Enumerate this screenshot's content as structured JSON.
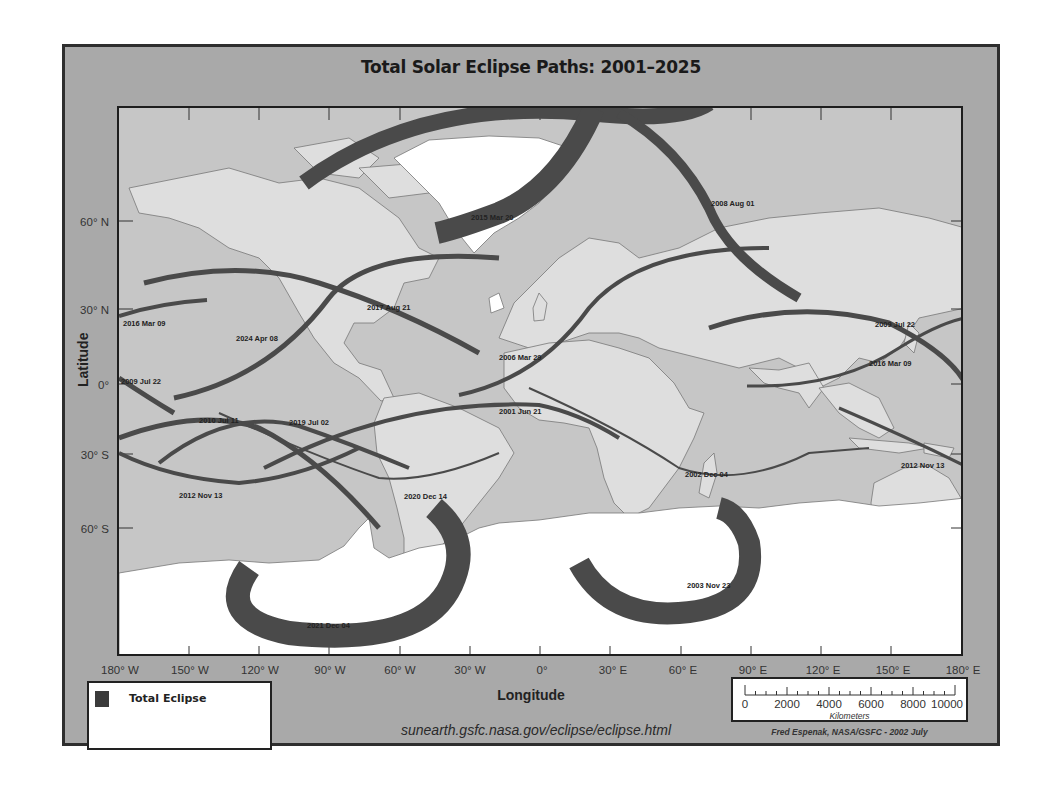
{
  "title": "Total Solar Eclipse Paths: 2001–2025",
  "axes": {
    "x_title": "Longitude",
    "y_title": "Latitude",
    "x_ticks": [
      "180° W",
      "150° W",
      "120° W",
      "90° W",
      "60° W",
      "30° W",
      "0°",
      "30° E",
      "60° E",
      "90° E",
      "120° E",
      "150° E",
      "180° E"
    ],
    "y_ticks": [
      "60° N",
      "30° N",
      "0°",
      "30° S",
      "60° S"
    ]
  },
  "legend": {
    "items": [
      {
        "label": "Total Eclipse",
        "color": "#3b3b3b"
      }
    ]
  },
  "scale_bar": {
    "values": [
      "0",
      "2000",
      "4000",
      "6000",
      "8000",
      "10000"
    ],
    "unit": "Kilometers"
  },
  "url": "sunearth.gsfc.nasa.gov/eclipse/eclipse.html",
  "credit": "Fred Espenak, NASA/GSFC - 2002 July",
  "eclipse_paths": [
    {
      "date": "2001 Jun 21"
    },
    {
      "date": "2002 Dec 04"
    },
    {
      "date": "2003 Nov 23"
    },
    {
      "date": "2006 Mar 29"
    },
    {
      "date": "2008 Aug 01"
    },
    {
      "date": "2009 Jul 22"
    },
    {
      "date": "2010 Jul 11"
    },
    {
      "date": "2012 Nov 13"
    },
    {
      "date": "2015 Mar 20"
    },
    {
      "date": "2016 Mar 09"
    },
    {
      "date": "2017 Aug 21"
    },
    {
      "date": "2019 Jul 02"
    },
    {
      "date": "2020 Dec 14"
    },
    {
      "date": "2021 Dec 04"
    },
    {
      "date": "2024 Apr 08"
    }
  ],
  "map_labels": {
    "l2015": "2015 Mar 20",
    "l2008": "2008 Aug 01",
    "l2017": "2017 Aug 21",
    "l2016w": "2016 Mar 09",
    "l2024": "2024 Apr 08",
    "l2006": "2006 Mar 29",
    "l2009e": "2009 Jul 22",
    "l2016e": "2016 Mar 09",
    "l2009w": "2009 Jul 22",
    "l2001": "2001 Jun 21",
    "l2010": "2010 Jul 11",
    "l2019": "2019 Jul 02",
    "l2012w": "2012 Nov 13",
    "l2020": "2020 Dec 14",
    "l2002": "2002 Dec 04",
    "l2012e": "2012 Nov 13",
    "l2003": "2003 Nov 23",
    "l2021": "2021 Dec 04"
  },
  "colors": {
    "panel": "#a9a9a9",
    "ocean": "#c9c9c9",
    "land": "#dedede",
    "ice": "#ffffff",
    "path": "#4a4a4a"
  }
}
